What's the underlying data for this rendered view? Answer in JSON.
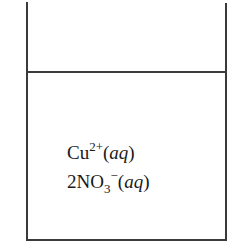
{
  "diagram": {
    "type": "beaker-solution",
    "line_color": "#3a3a3a",
    "species": [
      {
        "coefficient": "",
        "formula": "Cu",
        "subscript": "",
        "charge": "2+",
        "state_open": "(",
        "state": "aq",
        "state_close": ")"
      },
      {
        "coefficient": "2",
        "formula": "NO",
        "subscript": "3",
        "charge": "−",
        "state_open": "(",
        "state": "aq",
        "state_close": ")"
      }
    ]
  }
}
